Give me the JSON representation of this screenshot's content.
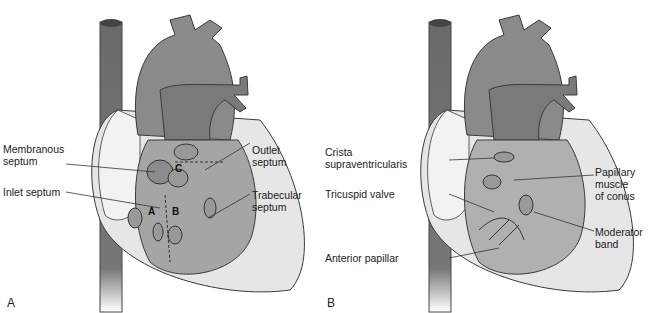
{
  "figure": {
    "panels": [
      {
        "letter": "A",
        "labels": {
          "membranous": "Membranous\nseptum",
          "inlet": "Inlet septum",
          "outlet": "Outlet\nseptum",
          "trabecular": "Trabecular\nseptum"
        },
        "inset_letters": {
          "a": "A",
          "b": "B",
          "c": "C"
        }
      },
      {
        "letter": "B",
        "labels": {
          "crista": "Crista\nsupraventricularis",
          "tricuspid": "Tricuspid valve",
          "anterior": "Anterior papillar",
          "papillary": "Papillary\nmuscle\nof conus",
          "moderator": "Moderator\nband"
        }
      }
    ],
    "colors": {
      "vessel_dark": "#6e6e6e",
      "aorta": "#8a8a8a",
      "heart_outer": "#e6e6e6",
      "chamber": "#a5a5a5",
      "outline": "#3a3a3a"
    }
  }
}
